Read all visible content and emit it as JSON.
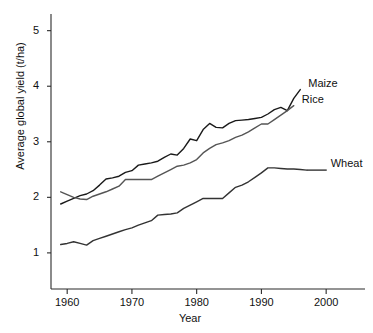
{
  "chart_data": {
    "type": "line",
    "title": "",
    "xlabel": "Year",
    "ylabel": "Average global yield (t/ha)",
    "xlim": [
      1957.5,
      2006
    ],
    "ylim": [
      0.35,
      5.3
    ],
    "grid": false,
    "legend_position": "right-inline-labels",
    "xticks": [
      1960,
      1970,
      1980,
      1990,
      2000
    ],
    "xtick_labels": [
      "1960",
      "1970",
      "1980",
      "1990",
      "2000"
    ],
    "yticks": [
      1,
      2,
      3,
      4,
      5
    ],
    "ytick_labels": [
      "1",
      "2",
      "3",
      "4",
      "5"
    ],
    "series": [
      {
        "name": "Maize",
        "color": "#1a1a1a",
        "label": "Maize",
        "x": [
          1959,
          1960,
          1961,
          1962,
          1963,
          1964,
          1965,
          1966,
          1967,
          1968,
          1969,
          1970,
          1971,
          1972,
          1973,
          1974,
          1975,
          1976,
          1977,
          1978,
          1979,
          1980,
          1981,
          1982,
          1983,
          1984,
          1985,
          1986,
          1987,
          1988,
          1989,
          1990,
          1991,
          1992,
          1993,
          1994,
          1995,
          1996
        ],
        "values": [
          1.88,
          1.93,
          1.98,
          2.03,
          2.06,
          2.12,
          2.22,
          2.33,
          2.35,
          2.38,
          2.45,
          2.48,
          2.58,
          2.6,
          2.62,
          2.65,
          2.72,
          2.78,
          2.76,
          2.88,
          3.05,
          3.02,
          3.22,
          3.33,
          3.26,
          3.25,
          3.33,
          3.38,
          3.39,
          3.4,
          3.42,
          3.44,
          3.5,
          3.58,
          3.62,
          3.56,
          3.78,
          3.94
        ]
      },
      {
        "name": "Rice",
        "color": "#555555",
        "label": "Rice",
        "x": [
          1959,
          1960,
          1961,
          1962,
          1963,
          1964,
          1965,
          1966,
          1967,
          1968,
          1969,
          1970,
          1971,
          1972,
          1973,
          1974,
          1975,
          1976,
          1977,
          1978,
          1979,
          1980,
          1981,
          1982,
          1983,
          1984,
          1985,
          1986,
          1987,
          1988,
          1989,
          1990,
          1991,
          1992,
          1993,
          1994,
          1995
        ],
        "values": [
          2.1,
          2.05,
          2.0,
          1.97,
          1.96,
          2.02,
          2.06,
          2.1,
          2.15,
          2.2,
          2.32,
          2.32,
          2.32,
          2.32,
          2.32,
          2.38,
          2.44,
          2.5,
          2.56,
          2.58,
          2.62,
          2.68,
          2.8,
          2.88,
          2.95,
          2.98,
          3.02,
          3.08,
          3.12,
          3.18,
          3.25,
          3.32,
          3.32,
          3.4,
          3.48,
          3.56,
          3.65
        ]
      },
      {
        "name": "Wheat",
        "color": "#333333",
        "label": "Wheat",
        "x": [
          1959,
          1960,
          1961,
          1962,
          1963,
          1964,
          1965,
          1966,
          1967,
          1968,
          1969,
          1970,
          1971,
          1972,
          1973,
          1974,
          1975,
          1976,
          1977,
          1978,
          1979,
          1980,
          1981,
          1982,
          1983,
          1984,
          1985,
          1986,
          1987,
          1988,
          1989,
          1990,
          1991,
          1992,
          1993,
          1994,
          1995,
          1996,
          1997
        ],
        "values": [
          1.15,
          1.17,
          1.2,
          1.17,
          1.14,
          1.22,
          1.26,
          1.3,
          1.34,
          1.38,
          1.42,
          1.45,
          1.5,
          1.54,
          1.58,
          1.68,
          1.69,
          1.7,
          1.72,
          1.8,
          1.86,
          1.92,
          1.98,
          1.98,
          1.98,
          1.98,
          2.08,
          2.18,
          2.22,
          2.28,
          2.36,
          2.44,
          2.53,
          2.53,
          2.52,
          2.51,
          2.51,
          2.5,
          2.49
        ]
      }
    ]
  },
  "axis": {
    "x_title": "Year",
    "y_title": "Average global yield (t/ha)"
  }
}
